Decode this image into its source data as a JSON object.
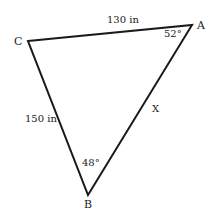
{
  "diagram": {
    "type": "triangle",
    "stroke_color": "#1a1a1a",
    "vertices": {
      "A": {
        "label": "A",
        "x": 192,
        "y": 25
      },
      "B": {
        "label": "B",
        "x": 88,
        "y": 195
      },
      "C": {
        "label": "C",
        "x": 28,
        "y": 41
      }
    },
    "sides": {
      "CA": {
        "label": "130 in"
      },
      "CB": {
        "label": "150 in"
      },
      "AB": {
        "label": "X"
      }
    },
    "angles": {
      "A": {
        "label": "52°"
      },
      "B": {
        "label": "48°"
      }
    }
  }
}
